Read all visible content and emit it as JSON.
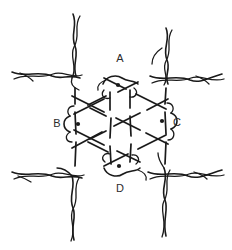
{
  "figure": {
    "background_color": "#ffffff",
    "ink_color": "#1a1a1a",
    "label_color": "#2b2b2b",
    "width": 232,
    "height": 250
  },
  "labels": [
    {
      "id": "A",
      "text": "A",
      "x": 120,
      "y": 62,
      "position": "top"
    },
    {
      "id": "B",
      "text": "B",
      "x": 57,
      "y": 127,
      "position": "left"
    },
    {
      "id": "C",
      "text": "C",
      "x": 177,
      "y": 126,
      "position": "right"
    },
    {
      "id": "D",
      "text": "D",
      "x": 120,
      "y": 192,
      "position": "bottom"
    }
  ],
  "nodes": [
    {
      "id": "A",
      "label": "A",
      "x": 118,
      "y": 85,
      "radius": 2.1
    },
    {
      "id": "B",
      "label": "B",
      "x": 78,
      "y": 124,
      "radius": 2.1
    },
    {
      "id": "C",
      "label": "C",
      "x": 162,
      "y": 121,
      "radius": 2.1
    },
    {
      "id": "D",
      "label": "D",
      "x": 119,
      "y": 166,
      "radius": 2.1
    }
  ],
  "legend": {
    "node_marker": "filled-dot",
    "line_style": "hand-drawn broken strokes indicating over/under crossings"
  }
}
